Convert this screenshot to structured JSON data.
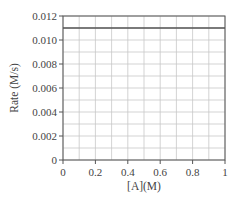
{
  "chart_data": {
    "type": "line",
    "title": "",
    "xlabel": "[A](M)",
    "ylabel": "Rate (M/s)",
    "xlim": [
      0,
      1
    ],
    "ylim": [
      0,
      0.012
    ],
    "x_ticks": [
      "0",
      "0.2",
      "0.4",
      "0.6",
      "0.8",
      "1"
    ],
    "y_ticks": [
      "0",
      "0.002",
      "0.004",
      "0.006",
      "0.008",
      "0.010",
      "0.012"
    ],
    "grid": true,
    "legend": null,
    "series": [
      {
        "name": "Rate",
        "x": [
          0,
          1
        ],
        "y": [
          0.011,
          0.011
        ]
      }
    ]
  },
  "colors": {
    "axis": "#555555",
    "grid": "#c8c8c8",
    "line": "#555555",
    "text": "#444444"
  }
}
